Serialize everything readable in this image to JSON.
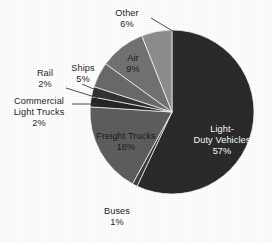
{
  "chart_data": {
    "type": "pie",
    "title": "",
    "subtitle": "",
    "xlabel": "",
    "ylabel": "",
    "legend_position": "none",
    "grid": false,
    "units": "percent",
    "start_angle_deg": 0,
    "direction": "clockwise",
    "categories": [
      "Light-Duty Vehicles",
      "Buses",
      "Freight Trucks",
      "Commercial Light Trucks",
      "Rail",
      "Ships",
      "Air",
      "Other"
    ],
    "values": [
      57,
      1,
      18,
      2,
      2,
      5,
      9,
      6
    ],
    "slices": [
      {
        "label": "Light-Duty Vehicles",
        "label_line1": "Light-",
        "label_line2": "Duty Vehicles",
        "percent_text": "57%",
        "value": 57,
        "color": "#2b2b2b",
        "label_placement": "inside",
        "label_color": "#ffffff"
      },
      {
        "label": "Buses",
        "percent_text": "1%",
        "value": 1,
        "color": "#3d3d3d",
        "label_placement": "outside",
        "label_color": "#1f1f1f"
      },
      {
        "label": "Freight Trucks",
        "percent_text": "18%",
        "value": 18,
        "color": "#5e5e5e",
        "label_placement": "inside",
        "label_color": "#1b1b1b"
      },
      {
        "label": "Commercial Light Trucks",
        "label_line1": "Commercial",
        "label_line2": "Light Trucks",
        "percent_text": "2%",
        "value": 2,
        "color": "#262626",
        "label_placement": "outside",
        "label_color": "#1f1f1f"
      },
      {
        "label": "Rail",
        "percent_text": "2%",
        "value": 2,
        "color": "#333333",
        "label_placement": "outside",
        "label_color": "#1f1f1f"
      },
      {
        "label": "Ships",
        "percent_text": "5%",
        "value": 5,
        "color": "#6a6a6a",
        "label_placement": "outside",
        "label_color": "#1f1f1f"
      },
      {
        "label": "Air",
        "percent_text": "9%",
        "value": 9,
        "color": "#737373",
        "label_placement": "inside",
        "label_color": "#1b1b1b"
      },
      {
        "label": "Other",
        "percent_text": "6%",
        "value": 6,
        "color": "#8e8e8e",
        "label_placement": "outside",
        "label_color": "#1f1f1f"
      }
    ]
  },
  "labels": {
    "light_duty_line1": "Light-",
    "light_duty_line2": "Duty Vehicles",
    "light_duty_pct": "57%",
    "freight_name": "Freight Trucks",
    "freight_pct": "18%",
    "air_name": "Air",
    "air_pct": "9%",
    "other_name": "Other",
    "other_pct": "6%",
    "ships_name": "Ships",
    "ships_pct": "5%",
    "rail_name": "Rail",
    "rail_pct": "2%",
    "clt_line1": "Commercial",
    "clt_line2": "Light Trucks",
    "clt_pct": "2%",
    "buses_name": "Buses",
    "buses_pct": "1%"
  }
}
